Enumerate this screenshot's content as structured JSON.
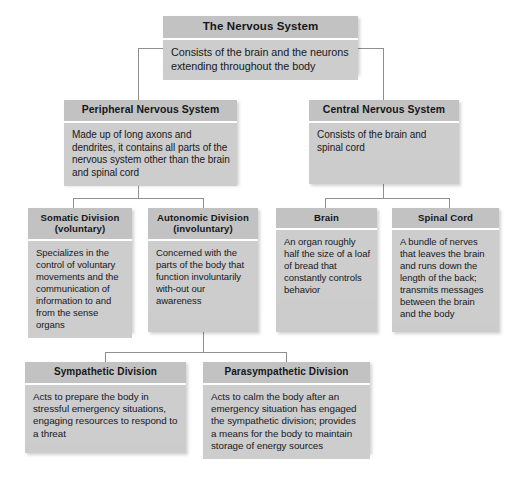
{
  "diagram": {
    "background_color": "#ffffff",
    "node_header_color": "#c2c2c2",
    "node_body_color": "#cdcdcd",
    "connector_color": "#8f8f8f",
    "nodes": {
      "nervous_system": {
        "title": "The Nervous System",
        "body": "Consists of the brain and the neurons extending throughout the body"
      },
      "peripheral": {
        "title": "Peripheral Nervous System",
        "body": "Made up of long axons and dendrites, it contains all parts of the nervous system other than the brain and spinal cord"
      },
      "central": {
        "title": "Central Nervous System",
        "body": "Consists of the brain and spinal cord"
      },
      "somatic": {
        "title": "Somatic Division (voluntary)",
        "title_line1": "Somatic Division",
        "title_line2": "(voluntary)",
        "body": "Specializes in the control of voluntary movements and the communication of information to and from the sense organs"
      },
      "autonomic": {
        "title": "Autonomic Division (involuntary)",
        "title_line1": "Autonomic Division",
        "title_line2": "(involuntary)",
        "body": "Concerned with the parts of the body that function involuntarily with-out our awareness"
      },
      "brain": {
        "title": "Brain",
        "body": "An organ roughly half the size of a loaf of bread that constantly controls behavior"
      },
      "spinal_cord": {
        "title": "Spinal Cord",
        "body": "A bundle of nerves that leaves the brain and runs down the length of the back; transmits messages between the brain and the body"
      },
      "sympathetic": {
        "title": "Sympathetic Division",
        "body": "Acts to prepare the body in stressful emergency situations, engaging resources to respond to a threat"
      },
      "parasympathetic": {
        "title": "Parasympathetic Division",
        "body": "Acts to calm the body after an emergency situation has engaged the sympathetic division; provides a means for the body to maintain storage of energy sources"
      }
    }
  }
}
